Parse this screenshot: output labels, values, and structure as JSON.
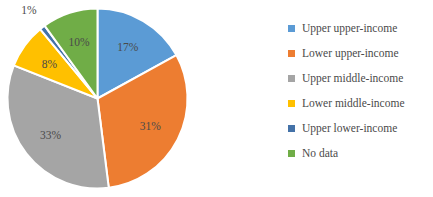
{
  "chart_data": {
    "type": "pie",
    "title": "",
    "legend_position": "right",
    "start_angle_deg": 0,
    "direction": "clockwise",
    "categories": [
      "Upper upper-income",
      "Lower upper-income",
      "Upper middle-income",
      "Lower middle-income",
      "Upper lower-income",
      "No data"
    ],
    "values": [
      17,
      31,
      33,
      8,
      1,
      10
    ],
    "value_labels": [
      "17%",
      "31%",
      "33%",
      "8%",
      "1%",
      "10%"
    ],
    "colors": [
      "#5b9bd5",
      "#ed7d31",
      "#a5a5a5",
      "#ffc000",
      "#4472a8",
      "#70ad47"
    ],
    "slices": [
      {
        "label": "Upper upper-income",
        "value": 17,
        "display": "17%",
        "color": "#5b9bd5"
      },
      {
        "label": "Lower upper-income",
        "value": 31,
        "display": "31%",
        "color": "#ed7d31"
      },
      {
        "label": "Upper middle-income",
        "value": 33,
        "display": "33%",
        "color": "#a5a5a5"
      },
      {
        "label": "Lower middle-income",
        "value": 8,
        "display": "8%",
        "color": "#ffc000"
      },
      {
        "label": "Upper lower-income",
        "value": 1,
        "display": "1%",
        "color": "#4472a8"
      },
      {
        "label": "No data",
        "value": 10,
        "display": "10%",
        "color": "#70ad47"
      }
    ]
  },
  "legend": {
    "items": [
      {
        "label": "Upper upper-income",
        "color": "#5b9bd5"
      },
      {
        "label": "Lower upper-income",
        "color": "#ed7d31"
      },
      {
        "label": "Upper middle-income",
        "color": "#a5a5a5"
      },
      {
        "label": "Lower middle-income",
        "color": "#ffc000"
      },
      {
        "label": "Upper lower-income",
        "color": "#4472a8"
      },
      {
        "label": "No data",
        "color": "#70ad47"
      }
    ]
  },
  "style": {
    "background": "#ffffff",
    "label_text_color": "#4a4a4a",
    "slice_border_color": "#ffffff"
  }
}
